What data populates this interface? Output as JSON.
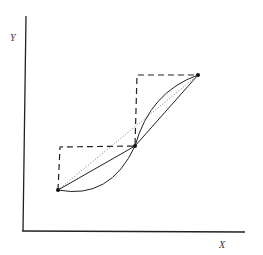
{
  "diagram": {
    "axes": {
      "y_label": "Y",
      "x_label": "X"
    },
    "points": [
      {
        "name": "lower",
        "x": 58,
        "y": 190
      },
      {
        "name": "middle",
        "x": 135,
        "y": 146
      },
      {
        "name": "upper",
        "x": 198,
        "y": 75
      }
    ],
    "series": [
      {
        "name": "step-function",
        "style": "dashed"
      },
      {
        "name": "straight-chord",
        "style": "solid"
      },
      {
        "name": "curved-arc",
        "style": "solid"
      },
      {
        "name": "reference-line",
        "style": "dotted"
      }
    ]
  }
}
